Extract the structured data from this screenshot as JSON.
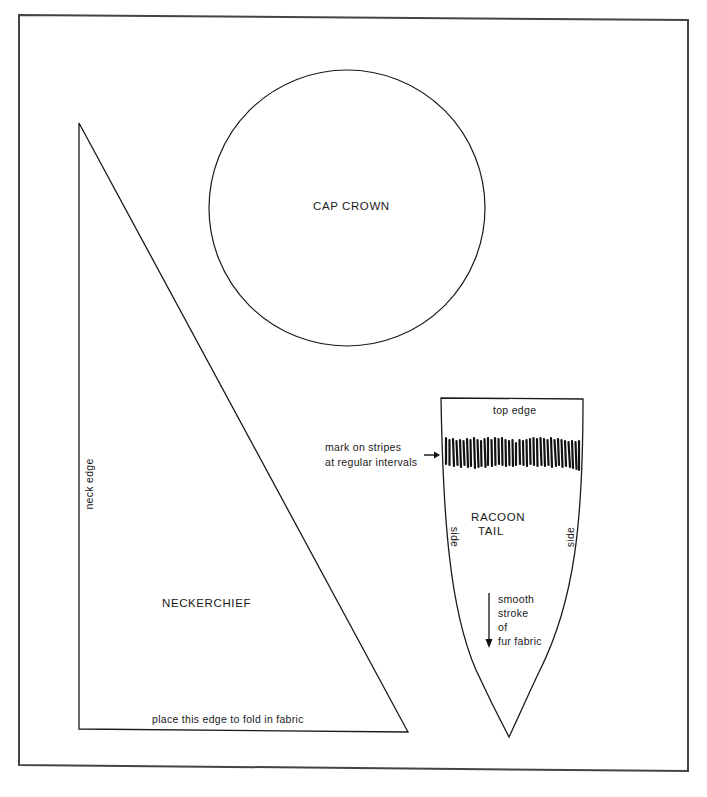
{
  "diagram": {
    "type": "sewing-pattern",
    "colors": {
      "line": "#1a1a1a",
      "border": "#444444",
      "background": "#ffffff"
    },
    "pieces": {
      "cap_crown": {
        "label": "CAP CROWN",
        "shape": "circle"
      },
      "neckerchief": {
        "label": "NECKERCHIEF",
        "shape": "right-triangle",
        "neck_edge_label": "neck edge",
        "fold_edge_label": "place this edge to fold in fabric"
      },
      "racoon_tail": {
        "label_line1": "RACOON",
        "label_line2": "TAIL",
        "shape": "pointed-shield",
        "top_edge_label": "top edge",
        "side_left_label": "side",
        "side_right_label": "side",
        "stripe_note_line1": "mark on stripes",
        "stripe_note_line2": "at regular intervals",
        "stroke_note_lines": [
          "smooth",
          "stroke",
          "of",
          "fur fabric"
        ]
      }
    }
  }
}
